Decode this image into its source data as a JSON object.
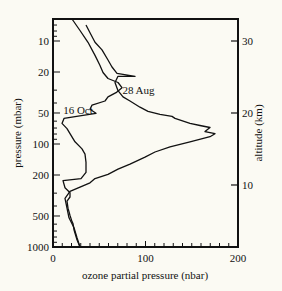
{
  "chart_data": {
    "type": "line",
    "title": "",
    "xlabel": "ozone partial pressure (nbar)",
    "ylabel": "pressure (mbar)",
    "y2label": "altitude (km)",
    "xlim": [
      0,
      200
    ],
    "ylim": [
      1000,
      6
    ],
    "yscale": "log",
    "x_ticks": [
      0,
      100,
      200
    ],
    "x_minor_step": 10,
    "y_ticks": [
      10,
      20,
      50,
      100,
      200,
      500,
      1000
    ],
    "y2_ticks": [
      {
        "label": "30",
        "pressure": 10
      },
      {
        "label": "20",
        "pressure": 50
      },
      {
        "label": "10",
        "pressure": 250
      }
    ],
    "grid": false,
    "legend": "none (curves labelled inline)",
    "annotations": [
      {
        "text": "16 Oct",
        "x": 11,
        "pressure": 47
      },
      {
        "text": "28 Aug",
        "x": 75,
        "pressure": 30
      }
    ],
    "series": [
      {
        "name": "16 Oct",
        "points": [
          [
            20.5,
            6.1
          ],
          [
            29.2,
            7.9
          ],
          [
            37.8,
            10.3
          ],
          [
            45.4,
            13.8
          ],
          [
            50.8,
            17.3
          ],
          [
            54.1,
            20.2
          ],
          [
            59.5,
            23.1
          ],
          [
            70.3,
            25.3
          ],
          [
            74.6,
            28.4
          ],
          [
            68.1,
            31.8
          ],
          [
            59.5,
            34.9
          ],
          [
            56.2,
            38.2
          ],
          [
            42.2,
            41.9
          ],
          [
            40.0,
            45.9
          ],
          [
            46.5,
            50.3
          ],
          [
            32.4,
            52.6
          ],
          [
            11.9,
            56.4
          ],
          [
            9.7,
            63.1
          ],
          [
            15.1,
            70.8
          ],
          [
            18.4,
            79.4
          ],
          [
            23.8,
            95.3
          ],
          [
            31.4,
            111.6
          ],
          [
            34.6,
            125.4
          ],
          [
            35.7,
            150.4
          ],
          [
            35.7,
            188.7
          ],
          [
            30.3,
            216.6
          ],
          [
            10.8,
            226.6
          ],
          [
            13.0,
            265.6
          ],
          [
            18.4,
            297.9
          ],
          [
            18.4,
            326.7
          ],
          [
            15.1,
            358.2
          ],
          [
            16.2,
            420.5
          ],
          [
            18.4,
            493.8
          ],
          [
            20.5,
            566.5
          ],
          [
            21.6,
            593.0
          ],
          [
            22.7,
            679.8
          ],
          [
            25.9,
            851.6
          ],
          [
            29.2,
            1000
          ]
        ]
      },
      {
        "name": "28 Aug",
        "points": [
          [
            35.7,
            7.0
          ],
          [
            40.0,
            8.3
          ],
          [
            45.4,
            10.3
          ],
          [
            53.0,
            12.2
          ],
          [
            59.5,
            15.3
          ],
          [
            63.8,
            17.9
          ],
          [
            69.2,
            20.6
          ],
          [
            88.6,
            22.0
          ],
          [
            70.3,
            22.0
          ],
          [
            67.0,
            25.3
          ],
          [
            70.3,
            30.4
          ],
          [
            75.7,
            34.9
          ],
          [
            83.2,
            38.2
          ],
          [
            94.1,
            43.9
          ],
          [
            102.7,
            48.1
          ],
          [
            115.7,
            51.5
          ],
          [
            128.6,
            53.9
          ],
          [
            131.9,
            56.4
          ],
          [
            148.1,
            63.1
          ],
          [
            158.9,
            66.1
          ],
          [
            169.7,
            69.2
          ],
          [
            164.3,
            75.8
          ],
          [
            175.1,
            79.4
          ],
          [
            169.7,
            85.0
          ],
          [
            148.1,
            95.3
          ],
          [
            126.5,
            106.6
          ],
          [
            110.3,
            119.5
          ],
          [
            99.5,
            133.9
          ],
          [
            83.2,
            156.6
          ],
          [
            70.3,
            175.7
          ],
          [
            59.5,
            196.7
          ],
          [
            45.4,
            216.6
          ],
          [
            40.0,
            238.2
          ],
          [
            29.2,
            261.9
          ],
          [
            18.4,
            288.0
          ],
          [
            13.0,
            337.0
          ],
          [
            15.1,
            420.5
          ],
          [
            17.3,
            521.1
          ],
          [
            22.7,
            651.5
          ],
          [
            25.9,
            813.7
          ],
          [
            29.2,
            1000
          ]
        ]
      }
    ]
  }
}
